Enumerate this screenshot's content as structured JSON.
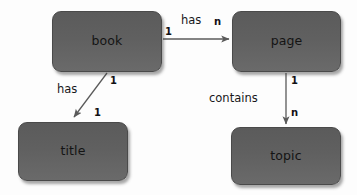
{
  "diagram": {
    "type": "entity-relationship-diagram",
    "background_color": "#fdfdfd",
    "entity_fill_color": "#606060",
    "entity_text_color": "#141414",
    "edge_color": "#5a5a5a",
    "entities": [
      {
        "id": "book",
        "label": "book"
      },
      {
        "id": "page",
        "label": "page"
      },
      {
        "id": "title",
        "label": "title"
      },
      {
        "id": "topic",
        "label": "topic"
      }
    ],
    "relationships": [
      {
        "id": "book-has-page",
        "label": "has",
        "from": "book",
        "to": "page",
        "source_cardinality": "1",
        "target_cardinality": "n"
      },
      {
        "id": "book-has-title",
        "label": "has",
        "from": "book",
        "to": "title",
        "source_cardinality": "1",
        "target_cardinality": "1"
      },
      {
        "id": "page-contains-topic",
        "label": "contains",
        "from": "page",
        "to": "topic",
        "source_cardinality": "1",
        "target_cardinality": "n"
      }
    ]
  }
}
